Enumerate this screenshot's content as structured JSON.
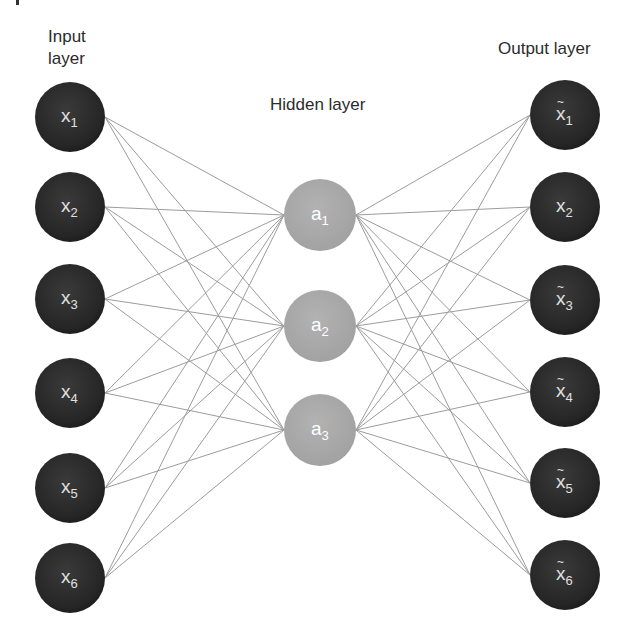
{
  "labels": {
    "input": [
      "Input",
      "layer"
    ],
    "hidden": "Hidden layer",
    "output": "Output layer"
  },
  "colors": {
    "input_node": "#2a2a2a",
    "hidden_node": "#a9a9a9",
    "output_node": "#2a2a2a",
    "edge": "#9c9c9c",
    "dark_node_text": "#e0e0e0",
    "hidden_node_text": "#ffffff",
    "label_text": "#2b2b2b"
  },
  "layers": {
    "input": {
      "x": 70,
      "r": 35,
      "nodes": [
        {
          "var": "x",
          "sub": "1",
          "tilde": false,
          "y": 117
        },
        {
          "var": "x",
          "sub": "2",
          "tilde": false,
          "y": 207
        },
        {
          "var": "x",
          "sub": "3",
          "tilde": false,
          "y": 299
        },
        {
          "var": "x",
          "sub": "4",
          "tilde": false,
          "y": 393
        },
        {
          "var": "x",
          "sub": "5",
          "tilde": false,
          "y": 488
        },
        {
          "var": "x",
          "sub": "6",
          "tilde": false,
          "y": 578
        }
      ]
    },
    "hidden": {
      "x": 320,
      "r": 36,
      "nodes": [
        {
          "var": "a",
          "sub": "1",
          "tilde": false,
          "y": 215
        },
        {
          "var": "a",
          "sub": "2",
          "tilde": false,
          "y": 326
        },
        {
          "var": "a",
          "sub": "3",
          "tilde": false,
          "y": 430
        }
      ]
    },
    "output": {
      "x": 565,
      "r": 35,
      "nodes": [
        {
          "var": "x",
          "sub": "1",
          "tilde": true,
          "y": 115
        },
        {
          "var": "x",
          "sub": "2",
          "tilde": false,
          "y": 207
        },
        {
          "var": "x",
          "sub": "3",
          "tilde": true,
          "y": 300
        },
        {
          "var": "x",
          "sub": "4",
          "tilde": true,
          "y": 392
        },
        {
          "var": "x",
          "sub": "5",
          "tilde": true,
          "y": 483
        },
        {
          "var": "x",
          "sub": "6",
          "tilde": true,
          "y": 575
        }
      ]
    }
  },
  "connectivity": "fully-connected between adjacent layers"
}
